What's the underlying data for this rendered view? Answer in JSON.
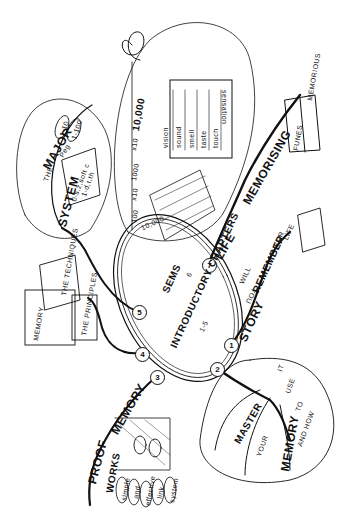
{
  "center": {
    "label": "INTRODUCTORY CHAPTERS",
    "range": "1-5",
    "semantic_label": "SEMS",
    "semantic_chapter": "6"
  },
  "branches": [
    {
      "num": "1",
      "words": [
        "STORY",
        "YOU",
        "WILL",
        "REMEMBER",
        "FOR",
        "LIFE"
      ]
    },
    {
      "num": "2",
      "words": [
        "MASTER",
        "YOUR",
        "MEMORY",
        "AND HOW",
        "TO",
        "USE",
        "IT"
      ]
    },
    {
      "num": "3",
      "words": [
        "MEMORY",
        "PROOF",
        "WORKS"
      ],
      "loops": [
        "simple",
        "and",
        "effective",
        "link",
        "system"
      ]
    },
    {
      "num": "4",
      "words": [
        "THE PRINCIPLES"
      ],
      "books": [
        "MEMORY",
        "THE TECHNIQUES",
        "THE PRINCIPLES"
      ]
    },
    {
      "num": "5",
      "words": [
        "THE",
        "MAJOR",
        "SYSTEM",
        "Peg"
      ],
      "leaves": [
        "1-10",
        "1-100"
      ],
      "scroll": [
        "0-s,z,soft c",
        "1-d,t,th"
      ]
    },
    {
      "num": "7",
      "words": [
        "LIFE",
        "MEMORISING"
      ],
      "book_pages": [
        "FUNES",
        "MEMORIOUS"
      ]
    }
  ],
  "sems_bubble": {
    "scale": [
      "100",
      "x10",
      "1000",
      "x10",
      "10,000",
      "∞"
    ],
    "sensation_header": "sensation",
    "senses": [
      "vision",
      "sound",
      "smell",
      "taste",
      "touch"
    ],
    "peg": "10,000"
  },
  "colors": {
    "ink": "#111111",
    "paper": "#ffffff"
  }
}
